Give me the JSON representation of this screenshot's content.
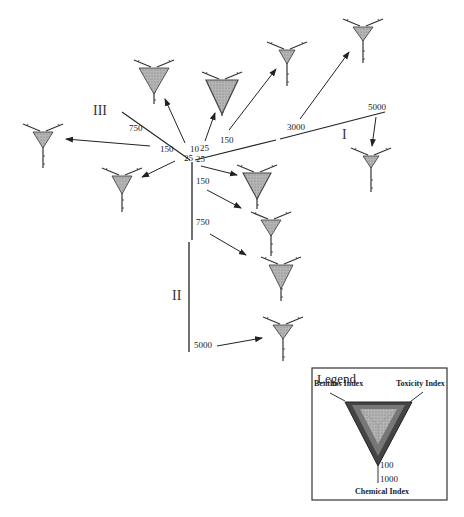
{
  "diagram": {
    "title": "",
    "transect_labels": {
      "I": "I",
      "II": "II",
      "III": "III"
    },
    "center_distance_labels": [
      "10",
      "25",
      "25",
      "25"
    ],
    "transect_I": {
      "label": "I",
      "distance_labels": [
        "150",
        "3000",
        "5000"
      ]
    },
    "transect_II": {
      "label": "II",
      "distance_labels": [
        "150",
        "750",
        "5000"
      ]
    },
    "transect_III": {
      "label": "III",
      "distance_labels": [
        "750",
        "150"
      ]
    },
    "legend": {
      "title": "Legend",
      "benthos_label": "Benthos Index",
      "toxicity_label": "Toxicity Index",
      "chemical_label": "Chemical Index",
      "tick_100": "100",
      "tick_1000": "1000"
    },
    "colors": {
      "line": "#222222",
      "triangle_fill": "#b8b8b8",
      "triangle_dark": "#5a5a5a",
      "legend_border": "#333333"
    }
  }
}
